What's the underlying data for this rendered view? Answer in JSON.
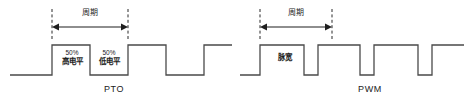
{
  "figure": {
    "title_pto": "PTO",
    "title_pwm": "PWM",
    "background": "#ffffff",
    "line_color": "#3b3b3b",
    "dash_color": "#2b2b2b"
  },
  "panels": [
    {
      "id": "pto",
      "caption": "PTO",
      "period_label": "周期",
      "annotations": [
        {
          "percent": "50%",
          "level": "高电平"
        },
        {
          "percent": "50%",
          "level": "低电平"
        }
      ],
      "duty_cycle": "50%",
      "waveform": {
        "type": "square",
        "baseline_y": 75,
        "top_y": 45,
        "points": "10,75 52,75 52,45 90,45 90,75 128,75 128,45 166,45 166,75 204,75 204,45 232,45"
      }
    },
    {
      "id": "pwm",
      "caption": "PWM",
      "period_label": "周期",
      "pulse_label": "脉宽",
      "waveform": {
        "type": "square",
        "baseline_y": 75,
        "top_y": 45,
        "points": "8,75 28,75 28,45 72,45 72,75 86,75 86,45 128,45 128,75 142,75 142,45 186,45 186,75 200,75 200,45 232,45"
      }
    }
  ],
  "markers": {
    "pto_period": {
      "start_x": 52,
      "end_x": 128,
      "arrow_y": 27,
      "dash_top": 10,
      "dash_bottom": 40
    },
    "pwm_period": {
      "start_x": 28,
      "end_x": 100,
      "arrow_y": 27,
      "dash_top": 10,
      "dash_bottom": 40
    }
  }
}
